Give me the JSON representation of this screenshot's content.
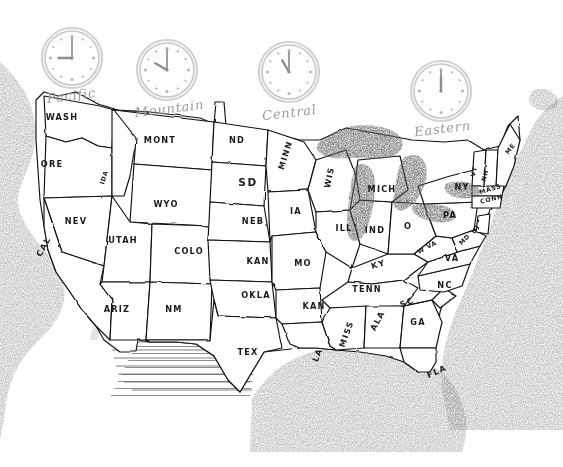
{
  "document": {
    "title": "United States Time Zone Map",
    "style": "hand-drawn pencil sketch",
    "background_color": "#ffffff",
    "ink_color": "#101010"
  },
  "zones": [
    {
      "id": "pacific",
      "label": "Pacific",
      "clock_time": "9:00",
      "hour": 9,
      "minute": 0,
      "clock_cx": 72,
      "clock_cy": 58,
      "clock_r": 27,
      "label_x": 72,
      "label_y": 100
    },
    {
      "id": "mountain",
      "label": "Mountain",
      "clock_time": "10:00",
      "hour": 10,
      "minute": 0,
      "clock_cx": 167,
      "clock_cy": 70,
      "clock_r": 27,
      "label_x": 170,
      "label_y": 113
    },
    {
      "id": "central",
      "label": "Central",
      "clock_time": "11:00",
      "hour": 11,
      "minute": 0,
      "clock_cx": 289,
      "clock_cy": 72,
      "clock_r": 27,
      "label_x": 290,
      "label_y": 117
    },
    {
      "id": "eastern",
      "label": "Eastern",
      "clock_time": "12:00",
      "hour": 12,
      "minute": 0,
      "clock_cx": 441,
      "clock_cy": 91,
      "clock_r": 27,
      "label_x": 443,
      "label_y": 133
    }
  ],
  "states": [
    {
      "abbr": "WASH",
      "x": 62,
      "y": 120,
      "size": "normal",
      "rotate": 0
    },
    {
      "abbr": "ORE",
      "x": 52,
      "y": 167,
      "size": "normal",
      "rotate": 0
    },
    {
      "abbr": "IDA",
      "x": 106,
      "y": 178,
      "size": "tiny",
      "rotate": -72
    },
    {
      "abbr": "MONT",
      "x": 160,
      "y": 143,
      "size": "normal",
      "rotate": 0
    },
    {
      "abbr": "WYO",
      "x": 166,
      "y": 207,
      "size": "normal",
      "rotate": 0
    },
    {
      "abbr": "NEV",
      "x": 76,
      "y": 224,
      "size": "normal",
      "rotate": 0
    },
    {
      "abbr": "CAL",
      "x": 46,
      "y": 248,
      "size": "normal",
      "rotate": -62
    },
    {
      "abbr": "UTAH",
      "x": 123,
      "y": 243,
      "size": "normal",
      "rotate": 0
    },
    {
      "abbr": "COLO",
      "x": 189,
      "y": 254,
      "size": "normal",
      "rotate": 0
    },
    {
      "abbr": "ARIZ",
      "x": 117,
      "y": 312,
      "size": "normal",
      "rotate": 0
    },
    {
      "abbr": "NM",
      "x": 174,
      "y": 312,
      "size": "normal",
      "rotate": 0
    },
    {
      "abbr": "ND",
      "x": 237,
      "y": 143,
      "size": "normal",
      "rotate": 0
    },
    {
      "abbr": "SD",
      "x": 248,
      "y": 186,
      "size": "big",
      "rotate": 0
    },
    {
      "abbr": "NEB",
      "x": 253,
      "y": 224,
      "size": "normal",
      "rotate": 0
    },
    {
      "abbr": "KAN",
      "x": 258,
      "y": 264,
      "size": "normal",
      "rotate": 0
    },
    {
      "abbr": "OKLA",
      "x": 256,
      "y": 298,
      "size": "normal",
      "rotate": 0
    },
    {
      "abbr": "TEX",
      "x": 248,
      "y": 355,
      "size": "normal",
      "rotate": 0
    },
    {
      "abbr": "MINN",
      "x": 288,
      "y": 156,
      "size": "normal",
      "rotate": -72
    },
    {
      "abbr": "IA",
      "x": 296,
      "y": 214,
      "size": "normal",
      "rotate": 0
    },
    {
      "abbr": "MO",
      "x": 303,
      "y": 266,
      "size": "normal",
      "rotate": 0
    },
    {
      "abbr": "KAN",
      "x": 314,
      "y": 309,
      "size": "normal",
      "rotate": 0
    },
    {
      "abbr": "LA",
      "x": 320,
      "y": 356,
      "size": "normal",
      "rotate": -68
    },
    {
      "abbr": "WIS",
      "x": 332,
      "y": 178,
      "size": "normal",
      "rotate": -78
    },
    {
      "abbr": "ILL",
      "x": 344,
      "y": 231,
      "size": "normal",
      "rotate": 0
    },
    {
      "abbr": "IND",
      "x": 375,
      "y": 233,
      "size": "normal",
      "rotate": 0
    },
    {
      "abbr": "MICH",
      "x": 382,
      "y": 192,
      "size": "normal",
      "rotate": 0
    },
    {
      "abbr": "KY",
      "x": 379,
      "y": 267,
      "size": "normal",
      "rotate": -16
    },
    {
      "abbr": "TENN",
      "x": 367,
      "y": 292,
      "size": "normal",
      "rotate": 0
    },
    {
      "abbr": "MISS",
      "x": 349,
      "y": 335,
      "size": "normal",
      "rotate": -70
    },
    {
      "abbr": "ALA",
      "x": 380,
      "y": 322,
      "size": "normal",
      "rotate": -62
    },
    {
      "abbr": "GA",
      "x": 418,
      "y": 325,
      "size": "normal",
      "rotate": 0
    },
    {
      "abbr": "FLA",
      "x": 438,
      "y": 374,
      "size": "normal",
      "rotate": -24
    },
    {
      "abbr": "SC",
      "x": 408,
      "y": 305,
      "size": "normal",
      "rotate": -22
    },
    {
      "abbr": "NC",
      "x": 445,
      "y": 288,
      "size": "normal",
      "rotate": 0
    },
    {
      "abbr": "VA",
      "x": 452,
      "y": 261,
      "size": "normal",
      "rotate": 0
    },
    {
      "abbr": "W VA",
      "x": 428,
      "y": 249,
      "size": "tiny",
      "rotate": -28
    },
    {
      "abbr": "O",
      "x": 408,
      "y": 229,
      "size": "normal",
      "rotate": 0
    },
    {
      "abbr": "PA",
      "x": 450,
      "y": 218,
      "size": "normal",
      "rotate": 0
    },
    {
      "abbr": "NY",
      "x": 462,
      "y": 190,
      "size": "normal",
      "rotate": 0
    },
    {
      "abbr": "MD",
      "x": 466,
      "y": 241,
      "size": "tiny",
      "rotate": -44
    },
    {
      "abbr": "NJ",
      "x": 477,
      "y": 230,
      "size": "tiny",
      "rotate": -62
    },
    {
      "abbr": "VT",
      "x": 476,
      "y": 172,
      "size": "tiny",
      "rotate": -76
    },
    {
      "abbr": "NH",
      "x": 487,
      "y": 176,
      "size": "tiny",
      "rotate": -76
    },
    {
      "abbr": "ME",
      "x": 512,
      "y": 150,
      "size": "tiny",
      "rotate": -52
    },
    {
      "abbr": "MASS",
      "x": 491,
      "y": 191,
      "size": "tiny",
      "rotate": -18
    },
    {
      "abbr": "CONN",
      "x": 492,
      "y": 201,
      "size": "tiny",
      "rotate": -14
    }
  ],
  "water_features": [
    {
      "name": "Pacific Ocean"
    },
    {
      "name": "Atlantic Ocean"
    },
    {
      "name": "Gulf of Mexico"
    },
    {
      "name": "Great Lakes"
    }
  ]
}
